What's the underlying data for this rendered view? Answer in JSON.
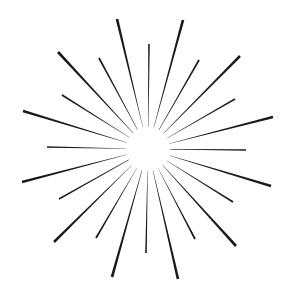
{
  "graphic": {
    "title": "Starburst",
    "background": "#ffffff",
    "ray_color": "#1a1a1a",
    "center": [
      148,
      149
    ],
    "inner_gap": 22,
    "rays": [
      {
        "end": [
          117,
          19
        ],
        "width": 2.6
      },
      {
        "end": [
          149,
          44
        ],
        "width": 1.6
      },
      {
        "end": [
          183,
          20
        ],
        "width": 2.6
      },
      {
        "end": [
          199,
          60
        ],
        "width": 1.8
      },
      {
        "end": [
          240,
          56
        ],
        "width": 2.6
      },
      {
        "end": [
          235,
          99
        ],
        "width": 1.8
      },
      {
        "end": [
          273,
          117
        ],
        "width": 2.6
      },
      {
        "end": [
          246,
          150
        ],
        "width": 1.6
      },
      {
        "end": [
          271,
          186
        ],
        "width": 2.6
      },
      {
        "end": [
          233,
          202
        ],
        "width": 1.8
      },
      {
        "end": [
          236,
          246
        ],
        "width": 2.6
      },
      {
        "end": [
          195,
          239
        ],
        "width": 1.8
      },
      {
        "end": [
          178,
          279
        ],
        "width": 2.6
      },
      {
        "end": [
          146,
          253
        ],
        "width": 1.6
      },
      {
        "end": [
          112,
          277
        ],
        "width": 2.6
      },
      {
        "end": [
          96,
          238
        ],
        "width": 1.8
      },
      {
        "end": [
          54,
          242
        ],
        "width": 2.6
      },
      {
        "end": [
          59,
          199
        ],
        "width": 1.8
      },
      {
        "end": [
          22,
          182
        ],
        "width": 2.6
      },
      {
        "end": [
          47,
          147
        ],
        "width": 1.6
      },
      {
        "end": [
          23,
          111
        ],
        "width": 2.6
      },
      {
        "end": [
          62,
          95
        ],
        "width": 1.8
      },
      {
        "end": [
          58,
          52
        ],
        "width": 2.6
      },
      {
        "end": [
          99,
          58
        ],
        "width": 1.8
      }
    ]
  }
}
